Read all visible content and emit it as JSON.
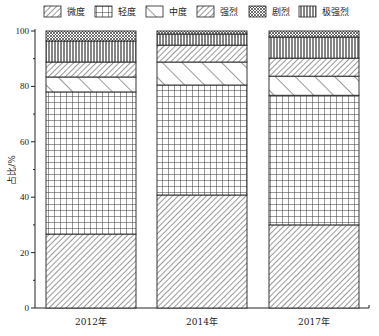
{
  "chart_data": {
    "type": "bar",
    "stacked": true,
    "title": "",
    "xlabel": "",
    "ylabel": "占比/%",
    "ylim": [
      0,
      100
    ],
    "yticks": [
      0,
      20,
      40,
      60,
      80,
      100
    ],
    "grid": false,
    "legend_position": "top",
    "categories": [
      "2012年",
      "2014年",
      "2017年"
    ],
    "series": [
      {
        "name": "微度",
        "pattern": "diagonal-hatch",
        "values": [
          26.7,
          40.8,
          30.0
        ]
      },
      {
        "name": "轻度",
        "pattern": "grid",
        "values": [
          51.3,
          39.7,
          46.8
        ]
      },
      {
        "name": "中度",
        "pattern": "backslash-wide",
        "values": [
          5.4,
          8.3,
          6.9
        ]
      },
      {
        "name": "强烈",
        "pattern": "diagonal-hatch",
        "values": [
          5.4,
          6.1,
          6.5
        ]
      },
      {
        "name": "极强烈",
        "pattern": "vertical-lines",
        "values": [
          7.6,
          4.0,
          7.6
        ]
      },
      {
        "name": "剧烈",
        "pattern": "crosshatch",
        "values": [
          3.6,
          1.1,
          2.2
        ]
      }
    ]
  },
  "legend": {
    "items": [
      {
        "label": "微度",
        "pattern": "diag"
      },
      {
        "label": "轻度",
        "pattern": "grid"
      },
      {
        "label": "中度",
        "pattern": "back"
      },
      {
        "label": "强烈",
        "pattern": "diag"
      },
      {
        "label": "剧烈",
        "pattern": "cross"
      },
      {
        "label": "极强烈",
        "pattern": "vert"
      }
    ]
  },
  "axes": {
    "ylabel": "占比/%",
    "yticks": [
      "0",
      "20",
      "40",
      "60",
      "80",
      "100"
    ],
    "xticks": [
      "2012年",
      "2014年",
      "2017年"
    ]
  },
  "colors": {
    "stroke": "#222222",
    "background": "#ffffff"
  }
}
